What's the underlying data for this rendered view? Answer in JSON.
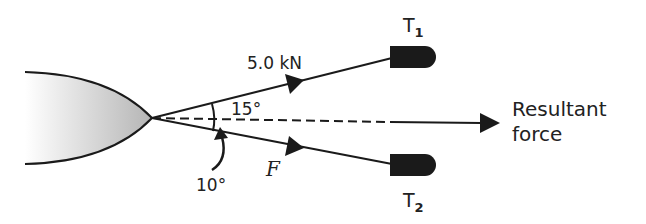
{
  "diagram": {
    "type": "force-diagram",
    "labels": {
      "force_top": "5.0 kN",
      "angle_top": "15°",
      "angle_bottom": "10°",
      "force_bottom": "F",
      "tug_top": "T",
      "tug_top_sub": "1",
      "tug_bottom": "T",
      "tug_bottom_sub": "2",
      "resultant_line1": "Resultant",
      "resultant_line2": "force"
    },
    "colors": {
      "line": "#1a1a1a",
      "tug": "#1a1a1a",
      "hull_dark": "#b5b5b5",
      "hull_light": "#ffffff"
    }
  }
}
